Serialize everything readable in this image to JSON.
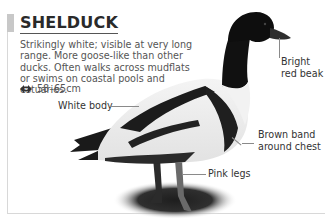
{
  "species": {
    "title": "SHELDUCK",
    "description": "Strikingly white; visible at very long range. More goose-like than other ducks. Often walks across mudflats or swims on coastal pools and estuaries.",
    "size_icon": "wingspan-arrows-icon",
    "size": "58–65cm"
  },
  "annotations": {
    "beak": "Bright red beak",
    "beak_line1": "Bright",
    "beak_line2": "red beak",
    "body": "White body",
    "chest_line1": "Brown band",
    "chest_line2": "around chest",
    "legs": "Pink legs"
  },
  "colors": {
    "title_bar": "#c8c8c8",
    "text": "#555555",
    "frame": "#d8d8d8"
  }
}
